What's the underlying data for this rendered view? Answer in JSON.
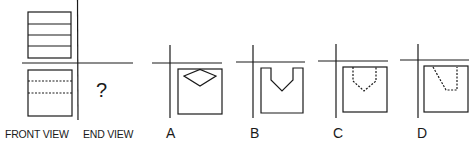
{
  "question": {
    "front_view_label": "FRONT VIEW",
    "end_view_label": "END VIEW",
    "unknown_symbol": "?"
  },
  "options": [
    {
      "label": "A",
      "description": "square with solid diamond near top"
    },
    {
      "label": "B",
      "description": "square with solid V-notch cut at top"
    },
    {
      "label": "C",
      "description": "square with hidden (dashed) V-notch at top"
    },
    {
      "label": "D",
      "description": "square with hidden (dashed) slanted notch at top"
    }
  ],
  "colors": {
    "line": "#1a1a1a",
    "background": "#ffffff"
  }
}
